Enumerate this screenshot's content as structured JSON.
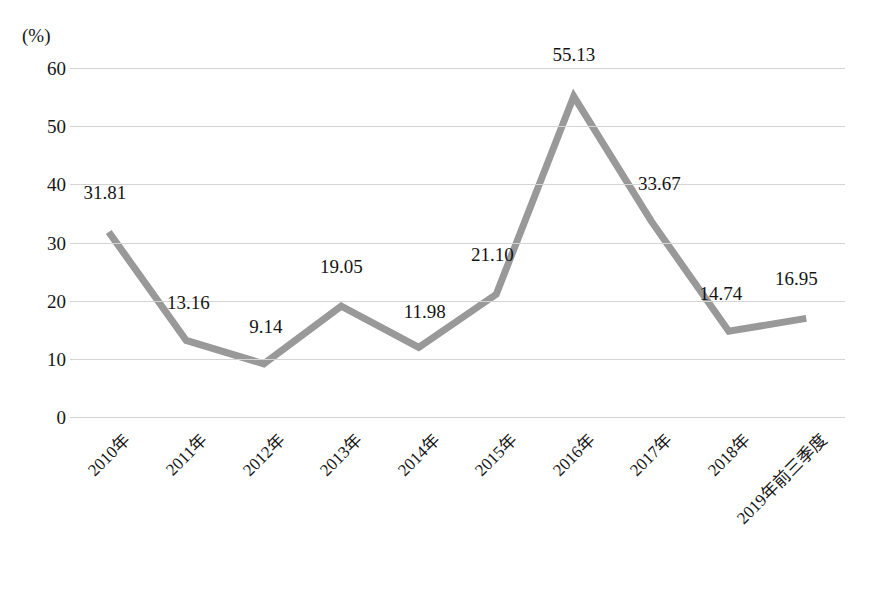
{
  "chart_data": {
    "type": "line",
    "title": "",
    "xlabel": "",
    "ylabel": "(%)",
    "unit_label": "(%)",
    "categories": [
      "2010年",
      "2011年",
      "2012年",
      "2013年",
      "2014年",
      "2015年",
      "2016年",
      "2017年",
      "2018年",
      "2019年前三季度"
    ],
    "values": [
      31.81,
      13.16,
      9.14,
      19.05,
      11.98,
      21.1,
      55.13,
      33.67,
      14.74,
      16.95
    ],
    "value_labels": [
      "31.81",
      "13.16",
      "9.14",
      "19.05",
      "11.98",
      "21.10",
      "55.13",
      "33.67",
      "14.74",
      "16.95"
    ],
    "ylim": [
      0,
      60
    ],
    "yticks": [
      60,
      50,
      40,
      30,
      20,
      10,
      0
    ],
    "ytick_labels": [
      "60",
      "50",
      "40",
      "30",
      "20",
      "10",
      "0"
    ],
    "grid": true,
    "legend": false,
    "series": [
      {
        "name": "",
        "values": [
          31.81,
          13.16,
          9.14,
          19.05,
          11.98,
          21.1,
          55.13,
          33.67,
          14.74,
          16.95
        ],
        "color": "#999999"
      }
    ],
    "colors": {
      "line": "#999999",
      "gridline": "#d4d4d4",
      "text": "#141414",
      "background": "#ffffff"
    },
    "label_offsets": [
      {
        "dx": -4,
        "dy": -40
      },
      {
        "dx": 2,
        "dy": -38
      },
      {
        "dx": 2,
        "dy": -38
      },
      {
        "dx": 0,
        "dy": -40
      },
      {
        "dx": 6,
        "dy": -36
      },
      {
        "dx": -4,
        "dy": -40
      },
      {
        "dx": 0,
        "dy": -42
      },
      {
        "dx": 8,
        "dy": -38
      },
      {
        "dx": -8,
        "dy": -38
      },
      {
        "dx": -10,
        "dy": -40
      }
    ]
  }
}
